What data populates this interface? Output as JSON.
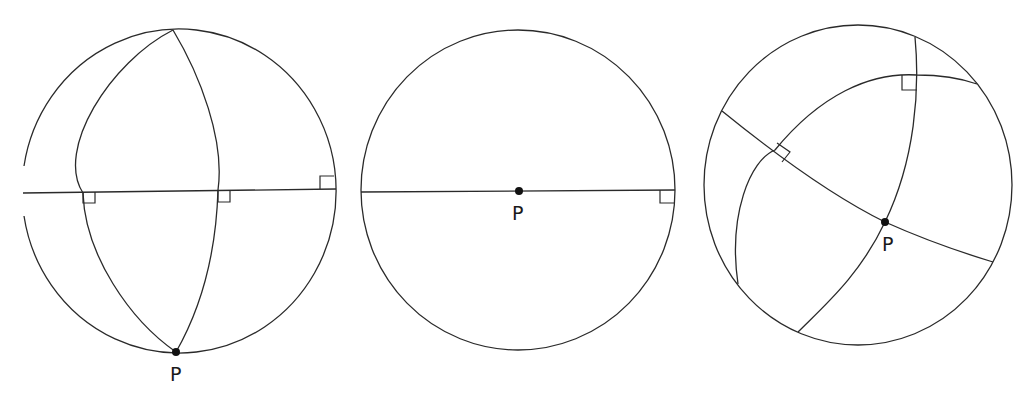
{
  "figure": {
    "panels": [
      {
        "id": "left",
        "description": "Sphere with pole P at bottom; two meridians from top to P, each crossing the equator at right angles",
        "point_label": "P",
        "right_angle_markers": 3
      },
      {
        "id": "middle",
        "description": "Sphere viewed with P at center on a horizontal diameter meeting the rim at a right angle",
        "point_label": "P",
        "right_angle_markers": 1
      },
      {
        "id": "right",
        "description": "Oblique sphere; two great-circle arcs through P, an outer arc meeting them at right angles",
        "point_label": "P",
        "right_angle_markers": 2
      }
    ],
    "colors": {
      "line": "#2a2a2a",
      "point": "#111111",
      "background": "#ffffff"
    }
  }
}
